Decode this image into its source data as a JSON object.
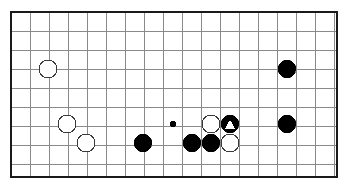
{
  "diagram": {
    "kind": "go-board-diagram",
    "board": {
      "columns": 18,
      "rows": 10,
      "cell_size": 19,
      "origin_x": 11,
      "origin_y": 12,
      "background_color": "#ffffff",
      "grid_color": "#8a8a8a",
      "border_color": "#1a1a1a",
      "border_width": 2,
      "left": 11,
      "top": 12,
      "right": 337,
      "bottom": 177
    },
    "stone_radius": 9,
    "hoshi_radius": 3,
    "colors": {
      "black_stone": "#000000",
      "white_stone": "#ffffff",
      "white_stone_outline": "#3a3a3a",
      "marker_white": "#ffffff",
      "marker_black": "#000000"
    },
    "hoshi_points": [
      {
        "name": "hoshi-center-left",
        "x": 173,
        "y": 124
      }
    ],
    "stones": [
      {
        "id": "w1",
        "color": "white",
        "x": 48,
        "y": 69,
        "marker": "none",
        "label": "white-stone-upper-left"
      },
      {
        "id": "b1",
        "color": "black",
        "x": 287,
        "y": 69,
        "marker": "none",
        "label": "black-stone-upper-right"
      },
      {
        "id": "w2",
        "color": "white",
        "x": 67,
        "y": 124,
        "marker": "none",
        "label": "white-stone-left-upper"
      },
      {
        "id": "w3",
        "color": "white",
        "x": 86,
        "y": 143,
        "marker": "none",
        "label": "white-stone-left-lower"
      },
      {
        "id": "b2",
        "color": "black",
        "x": 143,
        "y": 143,
        "marker": "none",
        "label": "black-stone-left-center"
      },
      {
        "id": "b3",
        "color": "black",
        "x": 192,
        "y": 143,
        "marker": "none",
        "label": "black-stone-center-lower-left"
      },
      {
        "id": "b4",
        "color": "black",
        "x": 211,
        "y": 143,
        "marker": "none",
        "label": "black-stone-center-lower-right"
      },
      {
        "id": "w4",
        "color": "white",
        "x": 211,
        "y": 124,
        "marker": "none",
        "label": "white-stone-center-upper"
      },
      {
        "id": "w5",
        "color": "white",
        "x": 230,
        "y": 143,
        "marker": "none",
        "label": "white-stone-center-lower"
      },
      {
        "id": "b5",
        "color": "black",
        "x": 230,
        "y": 124,
        "marker": "triangle-white",
        "label": "black-stone-marked-triangle"
      },
      {
        "id": "b6",
        "color": "black",
        "x": 287,
        "y": 124,
        "marker": "none",
        "label": "black-stone-right-lower"
      }
    ],
    "summary": {
      "black_stone_count": 6,
      "white_stone_count": 5,
      "marked_stone_count": 1,
      "marker_symbol": "triangle"
    }
  }
}
